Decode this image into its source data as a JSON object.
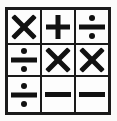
{
  "image": {
    "title": "Math operator symbol grid",
    "background_color": "#fbfbfa",
    "ink_color": "#111111",
    "border_color": "#1a1a1a",
    "rows": 3,
    "columns": 3
  },
  "grid": {
    "cells": [
      {
        "row": 1,
        "col": 1,
        "symbol": "×",
        "icon": "multiplication-icon",
        "name": "multiplication sign"
      },
      {
        "row": 1,
        "col": 2,
        "symbol": "+",
        "icon": "plus-icon",
        "name": "plus sign"
      },
      {
        "row": 1,
        "col": 3,
        "symbol": "÷",
        "icon": "division-icon",
        "name": "division sign"
      },
      {
        "row": 2,
        "col": 1,
        "symbol": "÷",
        "icon": "division-icon",
        "name": "division sign"
      },
      {
        "row": 2,
        "col": 2,
        "symbol": "×",
        "icon": "multiplication-icon",
        "name": "multiplication sign"
      },
      {
        "row": 2,
        "col": 3,
        "symbol": "×",
        "icon": "multiplication-icon",
        "name": "multiplication sign"
      },
      {
        "row": 3,
        "col": 1,
        "symbol": "÷",
        "icon": "division-icon",
        "name": "division sign"
      },
      {
        "row": 3,
        "col": 2,
        "symbol": "−",
        "icon": "minus-icon",
        "name": "minus sign"
      },
      {
        "row": 3,
        "col": 3,
        "symbol": "−",
        "icon": "minus-icon",
        "name": "minus sign"
      }
    ]
  }
}
